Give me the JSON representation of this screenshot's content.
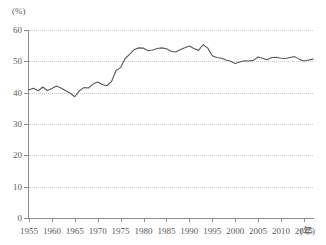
{
  "chart_data": {
    "type": "line",
    "title": "",
    "subtitle": "",
    "xlabel": "年",
    "ylabel": "(%)",
    "ylim": [
      0,
      60
    ],
    "xlim": [
      1955,
      2017
    ],
    "grid": true,
    "legend": "none",
    "y_ticks": [
      0,
      10,
      20,
      30,
      40,
      50,
      60
    ],
    "x_ticks": [
      1955,
      1960,
      1965,
      1970,
      1975,
      1980,
      1985,
      1990,
      1995,
      2000,
      2005,
      2010,
      2015
    ],
    "line_color": "#595959",
    "grid_color": "#c9c9c9",
    "axis_color": "#8c8c8c",
    "series": [
      {
        "name": "比率",
        "x": [
          1955,
          1956,
          1957,
          1958,
          1959,
          1960,
          1961,
          1962,
          1963,
          1964,
          1965,
          1966,
          1967,
          1968,
          1969,
          1970,
          1971,
          1972,
          1973,
          1974,
          1975,
          1976,
          1977,
          1978,
          1979,
          1980,
          1981,
          1982,
          1983,
          1984,
          1985,
          1986,
          1987,
          1988,
          1989,
          1990,
          1991,
          1992,
          1993,
          1994,
          1995,
          1996,
          1997,
          1998,
          1999,
          2000,
          2001,
          2002,
          2003,
          2004,
          2005,
          2006,
          2007,
          2008,
          2009,
          2010,
          2011,
          2012,
          2013,
          2014,
          2015,
          2016,
          2017
        ],
        "values": [
          40.9,
          41.4,
          40.6,
          41.8,
          40.7,
          41.3,
          42.1,
          41.5,
          40.6,
          39.8,
          38.7,
          40.6,
          41.6,
          41.5,
          42.8,
          43.4,
          42.6,
          42.2,
          43.5,
          47.1,
          48.0,
          50.9,
          52.3,
          53.8,
          54.3,
          54.2,
          53.4,
          53.6,
          54.1,
          54.3,
          54.0,
          53.2,
          53.0,
          53.7,
          54.3,
          54.9,
          54.1,
          53.5,
          55.3,
          54.3,
          51.8,
          51.2,
          51.0,
          50.4,
          50.0,
          49.3,
          49.8,
          50.2,
          50.1,
          50.3,
          51.4,
          51.0,
          50.5,
          51.2,
          51.3,
          51.0,
          50.9,
          51.2,
          51.5,
          50.7,
          50.1,
          50.4,
          50.7
        ]
      }
    ]
  }
}
